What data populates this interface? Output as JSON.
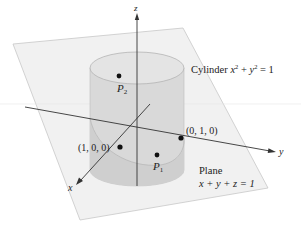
{
  "figure": {
    "type": "3d-surface-intersection"
  },
  "axes": {
    "x_label": "x",
    "y_label": "y",
    "z_label": "z"
  },
  "surfaces": {
    "cylinder": {
      "label_prefix": "Cylinder ",
      "equation_parts": [
        "x",
        "2",
        " + ",
        "y",
        "2",
        " = 1"
      ]
    },
    "plane": {
      "label": "Plane",
      "equation": "x + y + z = 1"
    }
  },
  "points": [
    {
      "name": "point-1-0-0",
      "label": "(1, 0, 0)"
    },
    {
      "name": "point-0-1-0",
      "label": "(0, 1, 0)"
    },
    {
      "name": "point-p1",
      "label": "P",
      "subscript": "1"
    },
    {
      "name": "point-p2",
      "label": "P",
      "subscript": "2"
    }
  ],
  "colors": {
    "plane_fill": "#f1f1f1",
    "plane_edge": "#c8c8c8",
    "cylinder_fill": "#d9d9d9",
    "cylinder_top": "#e4e4e4",
    "cylinder_edge": "#b4b4b4",
    "ellipse_shadow": "#c9c9c9",
    "axis": "#333333"
  }
}
